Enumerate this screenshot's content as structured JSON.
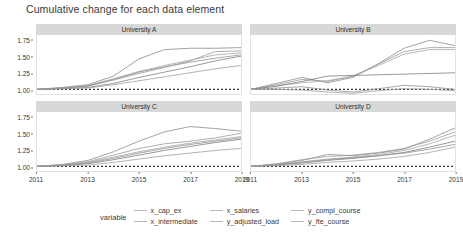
{
  "chart_data": {
    "type": "line",
    "title": "Cumulative change for each data element",
    "xlabel": "",
    "ylabel": "",
    "xlim": [
      2011,
      2019
    ],
    "ylim": [
      0.93,
      1.82
    ],
    "yticks": [
      "1.00",
      "1.25",
      "1.50",
      "1.75"
    ],
    "ytick_values": [
      1.0,
      1.25,
      1.5,
      1.75
    ],
    "xticks": [
      "2011",
      "2013",
      "2015",
      "2017",
      "2019"
    ],
    "xtick_values": [
      2011,
      2013,
      2015,
      2017,
      2019
    ],
    "grid": false,
    "legend_position": "bottom",
    "legend_title": "variable",
    "reference_line": {
      "value": 1.0,
      "style": "dotted"
    },
    "x": [
      2011,
      2012,
      2013,
      2014,
      2015,
      2016,
      2017,
      2018,
      2019
    ],
    "facets": [
      {
        "label": "University A",
        "series": [
          {
            "name": "x_cap_ex",
            "values": [
              1.0,
              1.03,
              1.07,
              1.2,
              1.46,
              1.6,
              1.62,
              1.62,
              1.63
            ]
          },
          {
            "name": "x_intermediate",
            "values": [
              1.0,
              1.02,
              1.05,
              1.14,
              1.24,
              1.33,
              1.43,
              1.57,
              1.58
            ]
          },
          {
            "name": "x_salaries",
            "values": [
              1.0,
              1.02,
              1.06,
              1.16,
              1.27,
              1.36,
              1.44,
              1.52,
              1.55
            ]
          },
          {
            "name": "y_adjusted_load",
            "values": [
              1.0,
              1.01,
              1.03,
              1.09,
              1.18,
              1.26,
              1.34,
              1.43,
              1.5
            ]
          },
          {
            "name": "y_compl_course",
            "values": [
              1.0,
              1.02,
              1.05,
              1.15,
              1.26,
              1.34,
              1.41,
              1.47,
              1.52
            ]
          },
          {
            "name": "y_fte_course",
            "values": [
              1.0,
              1.01,
              1.02,
              1.07,
              1.13,
              1.19,
              1.25,
              1.31,
              1.36
            ]
          }
        ]
      },
      {
        "label": "University B",
        "series": [
          {
            "name": "x_cap_ex",
            "values": [
              1.0,
              1.09,
              1.18,
              1.1,
              1.18,
              1.39,
              1.62,
              1.74,
              1.66
            ]
          },
          {
            "name": "x_intermediate",
            "values": [
              1.0,
              1.07,
              1.15,
              1.12,
              1.2,
              1.38,
              1.57,
              1.63,
              1.63
            ]
          },
          {
            "name": "x_salaries",
            "values": [
              1.0,
              1.05,
              1.1,
              1.13,
              1.2,
              1.36,
              1.53,
              1.6,
              1.6
            ]
          },
          {
            "name": "y_adjusted_load",
            "values": [
              1.0,
              1.05,
              1.12,
              1.2,
              1.21,
              1.22,
              1.23,
              1.24,
              1.25
            ]
          },
          {
            "name": "y_compl_course",
            "values": [
              1.0,
              1.02,
              1.04,
              0.99,
              0.96,
              1.01,
              1.06,
              1.04,
              1.0
            ]
          },
          {
            "name": "y_fte_course",
            "values": [
              1.0,
              1.0,
              0.99,
              0.96,
              0.94,
              0.98,
              1.01,
              1.0,
              0.98
            ]
          }
        ]
      },
      {
        "label": "University C",
        "series": [
          {
            "name": "x_cap_ex",
            "values": [
              1.0,
              1.03,
              1.09,
              1.22,
              1.38,
              1.52,
              1.6,
              1.57,
              1.53
            ]
          },
          {
            "name": "x_intermediate",
            "values": [
              1.0,
              1.02,
              1.07,
              1.17,
              1.27,
              1.34,
              1.38,
              1.43,
              1.5
            ]
          },
          {
            "name": "x_salaries",
            "values": [
              1.0,
              1.02,
              1.06,
              1.14,
              1.22,
              1.29,
              1.35,
              1.4,
              1.45
            ]
          },
          {
            "name": "y_adjusted_load",
            "values": [
              1.0,
              1.01,
              1.04,
              1.1,
              1.17,
              1.24,
              1.3,
              1.36,
              1.41
            ]
          },
          {
            "name": "y_compl_course",
            "values": [
              1.0,
              1.02,
              1.05,
              1.12,
              1.2,
              1.27,
              1.33,
              1.38,
              1.43
            ]
          },
          {
            "name": "y_fte_course",
            "values": [
              1.0,
              1.01,
              1.02,
              1.06,
              1.11,
              1.16,
              1.2,
              1.24,
              1.27
            ]
          }
        ]
      },
      {
        "label": "University D",
        "series": [
          {
            "name": "x_cap_ex",
            "values": [
              1.0,
              1.03,
              1.09,
              1.18,
              1.16,
              1.2,
              1.26,
              1.41,
              1.58
            ]
          },
          {
            "name": "x_intermediate",
            "values": [
              1.0,
              1.04,
              1.1,
              1.15,
              1.17,
              1.21,
              1.27,
              1.38,
              1.52
            ]
          },
          {
            "name": "x_salaries",
            "values": [
              1.0,
              1.03,
              1.07,
              1.11,
              1.14,
              1.18,
              1.24,
              1.34,
              1.47
            ]
          },
          {
            "name": "y_adjusted_load",
            "values": [
              1.0,
              1.02,
              1.05,
              1.09,
              1.12,
              1.16,
              1.21,
              1.29,
              1.38
            ]
          },
          {
            "name": "y_compl_course",
            "values": [
              1.0,
              1.02,
              1.06,
              1.1,
              1.13,
              1.16,
              1.2,
              1.26,
              1.33
            ]
          },
          {
            "name": "y_fte_course",
            "values": [
              1.0,
              1.01,
              1.03,
              1.06,
              1.08,
              1.11,
              1.15,
              1.21,
              1.29
            ]
          }
        ]
      }
    ],
    "legend_entries": [
      {
        "label": "x_cap_ex",
        "color": "#b9b9b9"
      },
      {
        "label": "x_intermediate",
        "color": "#b9b9b9"
      },
      {
        "label": "x_salaries",
        "color": "#b9b9b9"
      },
      {
        "label": "y_adjusted_load",
        "color": "#b9b9b9"
      },
      {
        "label": "y_compl_course",
        "color": "#b9b9b9"
      },
      {
        "label": "y_fte_course",
        "color": "#b9b9b9"
      }
    ],
    "series_colors": [
      "#8d8d8d",
      "#9a9a9a",
      "#a5a5a5",
      "#7f7f7f",
      "#909090",
      "#a0a0a0"
    ]
  }
}
